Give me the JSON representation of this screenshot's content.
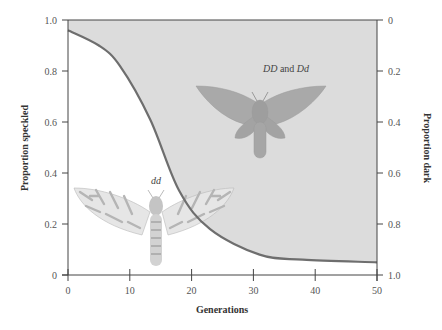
{
  "chart_data": {
    "type": "area",
    "title": "",
    "xlabel": "Generations",
    "ylabel": "Proportion speckled",
    "ylabel_right": "Proportion dark",
    "xlim": [
      0,
      50
    ],
    "ylim": [
      0,
      1.0
    ],
    "ylim_right": [
      1.0,
      0
    ],
    "x_ticks": [
      "0",
      "10",
      "20",
      "30",
      "40",
      "50"
    ],
    "y_ticks": [
      "0",
      "0.2",
      "0.4",
      "0.6",
      "0.8",
      "1.0"
    ],
    "y_ticks_right": [
      "0",
      "0.2",
      "0.4",
      "0.6",
      "0.8",
      "1.0"
    ],
    "grid": false,
    "legend": null,
    "series": [
      {
        "name": "Proportion speckled (dd)",
        "x": [
          0,
          5,
          8.4,
          13.3,
          18,
          23,
          31,
          38,
          50
        ],
        "values": [
          0.96,
          0.9,
          0.82,
          0.61,
          0.33,
          0.18,
          0.08,
          0.06,
          0.05
        ]
      }
    ],
    "annotations": [
      {
        "text_italic": "DD",
        "text_plain": " and ",
        "text_italic2": "Dd",
        "region": "shaded area above curve (dark moths)"
      },
      {
        "text_italic": "dd",
        "region": "white area below curve (speckled moths)"
      }
    ],
    "fill_color": "#dcdcdc",
    "curve_color": "#6e6e6e"
  },
  "labels": {
    "x_axis_title": "Generations",
    "y_axis_title": "Proportion speckled",
    "y2_axis_title": "Proportion dark",
    "annot_dark_a": "DD",
    "annot_dark_b": " and ",
    "annot_dark_c": "Dd",
    "annot_speckled": "dd"
  }
}
